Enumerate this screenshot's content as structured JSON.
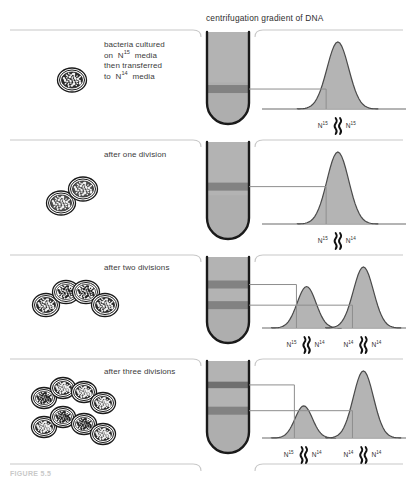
{
  "figure": {
    "header_title": "centrifugation gradient of DNA",
    "caption": "FIGURE 5.5",
    "colors": {
      "gradient_fill": "#b3b3b3",
      "band_dark": "#828282",
      "band_darkest": "#6f6f6f",
      "curve_fill": "#b0b0b0",
      "curve_stroke": "#4a4a4a",
      "tube_stroke": "#1a1a1a",
      "divider": "#c8c8c8",
      "connector": "#8e8e8e",
      "cell_stroke": "#1a1a1a",
      "text": "#3a3a3a"
    }
  },
  "rows": [
    {
      "id": "row-generation-0",
      "label": "bacteria cultured\non  N15  media\nthen transferred\nto  N14  media",
      "label_lines": [
        {
          "pre": "bacteria cultured",
          "iso": "",
          "post": ""
        },
        {
          "pre": "on  N",
          "iso": "15",
          "post": "  media"
        },
        {
          "pre": "then transferred",
          "iso": "",
          "post": ""
        },
        {
          "pre": "to  N",
          "iso": "14",
          "post": "  media"
        }
      ],
      "cell_count": 1,
      "cells_shading": [
        "dark"
      ],
      "tube_bands": [
        {
          "position_pct": 62,
          "weight": "heavy"
        }
      ],
      "peaks": [
        {
          "center_pct": 52,
          "height_pct": 100,
          "width_pct": 30,
          "left_label": "N15",
          "right_label": "N15",
          "dna_strands": 2
        }
      ],
      "peak_labels": [
        {
          "left": {
            "element": "N",
            "mass": "15"
          },
          "right": {
            "element": "N",
            "mass": "15"
          }
        }
      ]
    },
    {
      "id": "row-generation-1",
      "label": "after one division",
      "label_lines": [
        {
          "pre": "after one division",
          "iso": "",
          "post": ""
        }
      ],
      "cell_count": 2,
      "cells_shading": [
        "medium",
        "medium"
      ],
      "tube_bands": [
        {
          "position_pct": 46,
          "weight": "heavy"
        }
      ],
      "peaks": [
        {
          "center_pct": 52,
          "height_pct": 100,
          "width_pct": 30,
          "left_label": "N15",
          "right_label": "N14",
          "dna_strands": 2
        }
      ],
      "peak_labels": [
        {
          "left": {
            "element": "N",
            "mass": "15"
          },
          "right": {
            "element": "N",
            "mass": "14"
          }
        }
      ]
    },
    {
      "id": "row-generation-2",
      "label": "after two divisions",
      "label_lines": [
        {
          "pre": "after two divisions",
          "iso": "",
          "post": ""
        }
      ],
      "cell_count": 4,
      "cells_shading": [
        "dark",
        "light",
        "light",
        "dark"
      ],
      "tube_bands": [
        {
          "position_pct": 32,
          "weight": "heavy"
        },
        {
          "position_pct": 56,
          "weight": "heavy"
        }
      ],
      "peaks": [
        {
          "center_pct": 30,
          "height_pct": 68,
          "width_pct": 26,
          "left_label": "N15",
          "right_label": "N14",
          "dna_strands": 2
        },
        {
          "center_pct": 70,
          "height_pct": 100,
          "width_pct": 28,
          "left_label": "N14",
          "right_label": "N14",
          "dna_strands": 2
        }
      ],
      "peak_labels": [
        {
          "left": {
            "element": "N",
            "mass": "15"
          },
          "right": {
            "element": "N",
            "mass": "14"
          }
        },
        {
          "left": {
            "element": "N",
            "mass": "14"
          },
          "right": {
            "element": "N",
            "mass": "14"
          }
        }
      ]
    },
    {
      "id": "row-generation-3",
      "label": "after three divisions",
      "label_lines": [
        {
          "pre": "after three divisions",
          "iso": "",
          "post": ""
        }
      ],
      "cell_count": 8,
      "cells_shading": [
        "light",
        "dark",
        "dark",
        "dark",
        "dark",
        "light",
        "light",
        "dark"
      ],
      "tube_bands": [
        {
          "position_pct": 26,
          "weight": "medium"
        },
        {
          "position_pct": 54,
          "weight": "heavy"
        }
      ],
      "peaks": [
        {
          "center_pct": 28,
          "height_pct": 48,
          "width_pct": 24,
          "left_label": "N15",
          "right_label": "N14",
          "dna_strands": 2
        },
        {
          "center_pct": 70,
          "height_pct": 100,
          "width_pct": 28,
          "left_label": "N14",
          "right_label": "N14",
          "dna_strands": 2
        }
      ],
      "peak_labels": [
        {
          "left": {
            "element": "N",
            "mass": "15"
          },
          "right": {
            "element": "N",
            "mass": "14"
          }
        },
        {
          "left": {
            "element": "N",
            "mass": "14"
          },
          "right": {
            "element": "N",
            "mass": "14"
          }
        }
      ]
    }
  ]
}
